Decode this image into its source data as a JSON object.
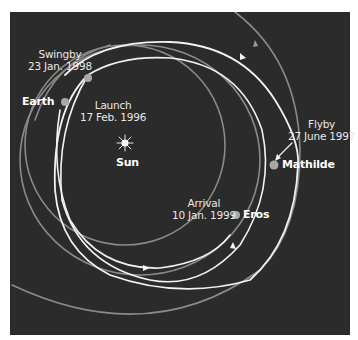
{
  "diagram": {
    "colors": {
      "background": "#2b2b2b",
      "page": "#ffffff",
      "trajectory": "#f2f2f2",
      "orbit": "#8a8a8a",
      "marker": "#a8a8a8",
      "label": "#e8e8e8"
    },
    "bodies": {
      "sun": {
        "label": "Sun"
      },
      "earth": {
        "label": "Earth"
      },
      "mathilde": {
        "label": "Mathilde"
      },
      "eros": {
        "label": "Eros"
      }
    },
    "events": {
      "swingby": {
        "title": "Swingby",
        "date": "23 Jan. 1998"
      },
      "launch": {
        "title": "Launch",
        "date": "17 Feb. 1996"
      },
      "flyby": {
        "title": "Flyby",
        "date": "27 June 1997"
      },
      "arrival": {
        "title": "Arrival",
        "date": "10 Jan. 1999"
      }
    },
    "icons": {
      "sun": "sun-icon",
      "planet_marker": "circle-marker-icon",
      "direction_arrow": "arrow-icon"
    }
  }
}
